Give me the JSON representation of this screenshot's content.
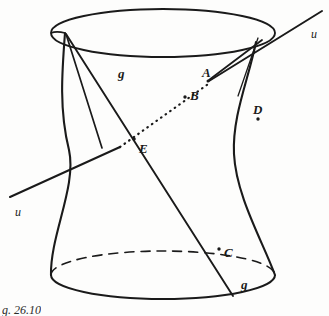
{
  "figure": {
    "caption": "g. 26.10",
    "background_color": "#fdfdfc",
    "ink_color": "#1a1a1a",
    "surface": {
      "name": "hyperboloid-of-one-sheet",
      "top_ellipse": {
        "cx": 163,
        "cy": 33,
        "rx": 112,
        "ry": 24,
        "style": "solid"
      },
      "bottom_ellipse": {
        "cx": 163,
        "cy": 275,
        "rx": 112,
        "ry": 24,
        "front_style": "solid",
        "back_style": "dashed"
      },
      "waist_x_left": 68,
      "waist_x_right": 240
    },
    "lines": [
      {
        "id": "g-upper",
        "label": "g",
        "style": "solid"
      },
      {
        "id": "g-lower",
        "label": "g",
        "style": "solid"
      },
      {
        "id": "u-left",
        "label": "u",
        "style": "solid"
      },
      {
        "id": "u-middle",
        "label": "",
        "style": "dotted"
      },
      {
        "id": "u-right",
        "label": "u",
        "style": "solid"
      }
    ],
    "labels": {
      "point_A": "A",
      "point_B": "B",
      "point_C": "C",
      "point_D": "D",
      "point_E": "E",
      "generator_upper": "g",
      "generator_lower": "g",
      "line_u_right": "u",
      "line_u_left": "u"
    },
    "points": [
      {
        "name": "A",
        "x": 207,
        "y": 79,
        "label_dx": 0,
        "label_dy": -13
      },
      {
        "name": "B",
        "x": 188,
        "y": 99,
        "label_dx": 6,
        "label_dy": -4
      },
      {
        "name": "C",
        "x": 222,
        "y": 251,
        "label_dx": 6,
        "label_dy": 1
      },
      {
        "name": "D",
        "x": 256,
        "y": 114,
        "label_dx": 1,
        "label_dy": -13
      },
      {
        "name": "E",
        "x": 137,
        "y": 141,
        "label_dx": 4,
        "label_dy": 6
      }
    ]
  }
}
